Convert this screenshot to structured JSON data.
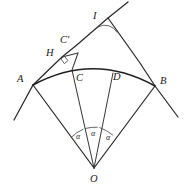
{
  "figure": {
    "background_color": "#ffffff",
    "stroke_color": "#2b2b2b",
    "arc_color": "#1f1f1f"
  },
  "points": [
    {
      "id": "I",
      "label": "I",
      "x": 108,
      "y": 18,
      "label_x": 93,
      "label_y": 11
    },
    {
      "id": "Cp",
      "label": "C'",
      "x": 78,
      "y": 53,
      "label_x": 60,
      "label_y": 35
    },
    {
      "id": "H",
      "label": "H",
      "x": 62,
      "y": 57,
      "label_x": 46,
      "label_y": 48
    },
    {
      "id": "A",
      "label": "A",
      "x": 33,
      "y": 85,
      "label_x": 17,
      "label_y": 74
    },
    {
      "id": "C",
      "label": "C",
      "x": 72,
      "y": 70,
      "label_x": 76,
      "label_y": 73
    },
    {
      "id": "D",
      "label": "D",
      "x": 113,
      "y": 73,
      "label_x": 113,
      "label_y": 72
    },
    {
      "id": "B",
      "label": "B",
      "x": 155,
      "y": 86,
      "label_x": 160,
      "label_y": 76
    },
    {
      "id": "O",
      "label": "O",
      "x": 94,
      "y": 168,
      "label_x": 90,
      "label_y": 174
    }
  ],
  "angles": [
    {
      "id": "alpha-left",
      "label": "α",
      "label_x": 76,
      "label_y": 133
    },
    {
      "id": "alpha-middle",
      "label": "α",
      "label_x": 91,
      "label_y": 130
    },
    {
      "id": "alpha-right",
      "label": "α",
      "label_x": 106,
      "label_y": 134
    }
  ],
  "markers": {
    "right_angle_at_h": "right-angle-square",
    "apex_angle_at_i": "angle-arc"
  },
  "segments": [
    {
      "name": "ray-through-A-and-I",
      "from": "lower-left",
      "to": "upper-right"
    },
    {
      "name": "ray-through-B-and-I",
      "from": "upper-left",
      "to": "lower-right"
    },
    {
      "name": "radius-OA",
      "from": "O",
      "to": "A"
    },
    {
      "name": "radius-OB",
      "from": "O",
      "to": "B"
    },
    {
      "name": "radius-OC-prime",
      "from": "O",
      "to": "C-prime"
    },
    {
      "name": "radius-OD",
      "from": "O",
      "to": "D"
    },
    {
      "name": "perpendicular-C-prime-H",
      "from": "C-prime",
      "to": "H"
    },
    {
      "name": "arc-A-to-B",
      "from": "A",
      "to": "B"
    }
  ]
}
